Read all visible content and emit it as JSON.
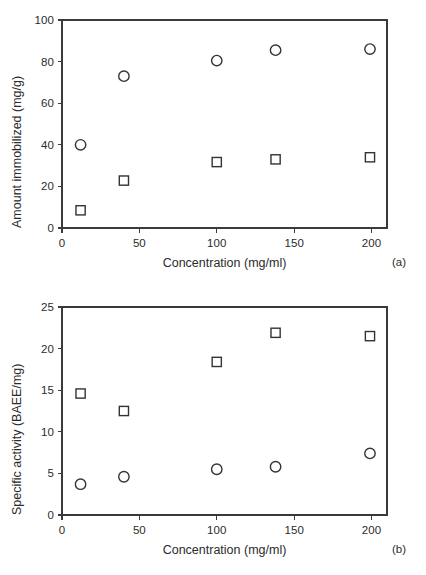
{
  "figure": {
    "background": "#ffffff",
    "marker_color": "#333333",
    "axis_color": "#3a3a3a"
  },
  "panels": [
    {
      "tag": "(a)",
      "tag_name": "panel-tag-a",
      "chart_data": {
        "type": "scatter",
        "title": "",
        "xlabel": "Concentration (mg/ml)",
        "ylabel": "Amount immobilized (mg/g)",
        "xlim": [
          0,
          210
        ],
        "ylim": [
          0,
          100
        ],
        "xticks": [
          0,
          50,
          100,
          150,
          200
        ],
        "yticks": [
          0,
          20,
          40,
          60,
          80,
          100
        ],
        "xtick_labels": [
          "0",
          "50",
          "100",
          "150",
          "200"
        ],
        "ytick_labels": [
          "0",
          "20",
          "40",
          "60",
          "80",
          "100"
        ],
        "grid": false,
        "legend": "none",
        "series": [
          {
            "name": "open-circle",
            "marker": "circle",
            "x": [
              12,
              40,
              100,
              138,
              199
            ],
            "y": [
              40.0,
              73.0,
              80.5,
              85.5,
              86.0
            ]
          },
          {
            "name": "open-square",
            "marker": "square",
            "x": [
              12,
              40,
              100,
              138,
              199
            ],
            "y": [
              8.5,
              22.8,
              31.7,
              33.0,
              34.0
            ]
          }
        ]
      }
    },
    {
      "tag": "(b)",
      "tag_name": "panel-tag-b",
      "chart_data": {
        "type": "scatter",
        "title": "",
        "xlabel": "Concentration (mg/ml)",
        "ylabel": "Specific activity (BAEE/mg)",
        "xlim": [
          0,
          210
        ],
        "ylim": [
          0,
          25
        ],
        "xticks": [
          0,
          50,
          100,
          150,
          200
        ],
        "yticks": [
          0,
          5,
          10,
          15,
          20,
          25
        ],
        "xtick_labels": [
          "0",
          "50",
          "100",
          "150",
          "200"
        ],
        "ytick_labels": [
          "0",
          "5",
          "10",
          "15",
          "20",
          "25"
        ],
        "grid": false,
        "legend": "none",
        "series": [
          {
            "name": "open-square",
            "marker": "square",
            "x": [
              12,
              40,
              100,
              138,
              199
            ],
            "y": [
              14.6,
              12.5,
              18.4,
              21.9,
              21.5
            ]
          },
          {
            "name": "open-circle",
            "marker": "circle",
            "x": [
              12,
              40,
              100,
              138,
              199
            ],
            "y": [
              3.7,
              4.6,
              5.5,
              5.8,
              7.4
            ]
          }
        ]
      }
    }
  ]
}
